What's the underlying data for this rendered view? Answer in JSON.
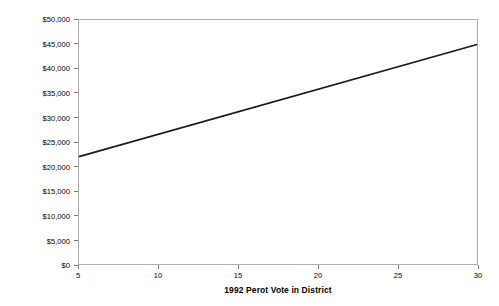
{
  "chart_data": {
    "type": "line",
    "title": "",
    "xlabel": "1992 Perot Vote in District",
    "ylabel": "1994 Republican Party Expenditures",
    "xlim": [
      5,
      30
    ],
    "ylim": [
      0,
      50000
    ],
    "grid": false,
    "legend": "none",
    "x_ticks": [
      {
        "value": 5,
        "label": "5"
      },
      {
        "value": 10,
        "label": "10"
      },
      {
        "value": 15,
        "label": "15"
      },
      {
        "value": 20,
        "label": "20"
      },
      {
        "value": 25,
        "label": "25"
      },
      {
        "value": 30,
        "label": "30"
      }
    ],
    "y_ticks": [
      {
        "value": 0,
        "label": "$0"
      },
      {
        "value": 5000,
        "label": "$5,000"
      },
      {
        "value": 10000,
        "label": "$10,000"
      },
      {
        "value": 15000,
        "label": "$15,000"
      },
      {
        "value": 20000,
        "label": "$20,000"
      },
      {
        "value": 25000,
        "label": "$25,000"
      },
      {
        "value": 30000,
        "label": "$30,000"
      },
      {
        "value": 35000,
        "label": "$35,000"
      },
      {
        "value": 40000,
        "label": "$40,000"
      },
      {
        "value": 45000,
        "label": "$45,000"
      },
      {
        "value": 50000,
        "label": "$50,000"
      }
    ],
    "series": [
      {
        "name": "Predicted expenditures",
        "color": "#1a1a1a",
        "line_width": 1.6,
        "x": [
          5,
          30
        ],
        "values": [
          22000,
          45000
        ]
      }
    ],
    "frame_color": "#aeaeae",
    "tick_color": "#7d7d7d",
    "background": "#ffffff"
  }
}
